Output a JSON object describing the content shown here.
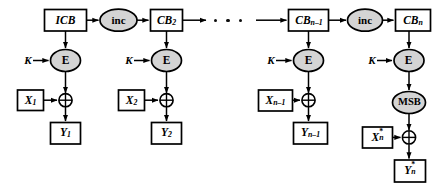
{
  "figure": {
    "type": "block-diagram",
    "width": 437,
    "height": 192,
    "background_color": "#ffffff",
    "stroke_color": "#000000",
    "ellipse_fill_color": "#d4d4d4",
    "rect_fill_color": "#ffffff"
  },
  "nodes": {
    "icb": {
      "label": "ICB",
      "shape": "rectangle"
    },
    "inc_1": {
      "label": "inc",
      "shape": "ellipse"
    },
    "cb_2": {
      "label": "CB",
      "sub": "2",
      "shape": "rectangle"
    },
    "cb_n_minus_1": {
      "label": "CB",
      "sub": "n–1",
      "shape": "rectangle"
    },
    "inc_2": {
      "label": "inc",
      "shape": "ellipse"
    },
    "cb_n": {
      "label": "CB",
      "sub": "n",
      "shape": "rectangle"
    },
    "e_1": {
      "label": "E",
      "shape": "ellipse"
    },
    "e_2": {
      "label": "E",
      "shape": "ellipse"
    },
    "e_3": {
      "label": "E",
      "shape": "ellipse"
    },
    "e_4": {
      "label": "E",
      "shape": "ellipse"
    },
    "msb": {
      "label": "MSB",
      "shape": "ellipse"
    },
    "k_1": {
      "label": "K",
      "shape": "text"
    },
    "k_2": {
      "label": "K",
      "shape": "text"
    },
    "k_3": {
      "label": "K",
      "shape": "text"
    },
    "k_4": {
      "label": "K",
      "shape": "text"
    },
    "x_1": {
      "label": "X",
      "sub": "1",
      "shape": "rectangle"
    },
    "x_2": {
      "label": "X",
      "sub": "2",
      "shape": "rectangle"
    },
    "x_n_minus_1": {
      "label": "X",
      "sub": "n–1",
      "shape": "rectangle"
    },
    "x_n_star": {
      "label": "X",
      "sub": "n",
      "sup": "*",
      "shape": "rectangle"
    },
    "y_1": {
      "label": "Y",
      "sub": "1",
      "shape": "rectangle"
    },
    "y_2": {
      "label": "Y",
      "sub": "2",
      "shape": "rectangle"
    },
    "y_n_minus_1": {
      "label": "Y",
      "sub": "n–1",
      "shape": "rectangle"
    },
    "y_n_star": {
      "label": "Y",
      "sub": "n",
      "sup": "*",
      "shape": "rectangle"
    },
    "xor_1": {
      "label": "⊕",
      "shape": "circle-xor"
    },
    "xor_2": {
      "label": "⊕",
      "shape": "circle-xor"
    },
    "xor_n_minus_1": {
      "label": "⊕",
      "shape": "circle-xor"
    },
    "xor_n": {
      "label": "⊕",
      "shape": "circle-xor"
    },
    "ellipsis": {
      "label": "• • •",
      "shape": "dots"
    }
  }
}
